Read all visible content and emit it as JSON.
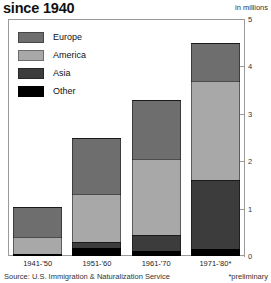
{
  "header": {
    "title": "since 1940",
    "units": "in millions"
  },
  "footer": {
    "source": "Source: U.S. Immigration & Naturalization Service",
    "footnote": "*preliminary"
  },
  "colors": {
    "europe": "#6e6e6e",
    "america": "#a8a8a8",
    "asia": "#3c3c3c",
    "other": "#000000",
    "axis": "#9a9a9a",
    "text": "#222222",
    "background": "#ffffff"
  },
  "legend": {
    "position": "top-left",
    "items": [
      {
        "label": "Europe",
        "color_key": "europe"
      },
      {
        "label": "America",
        "color_key": "america"
      },
      {
        "label": "Asia",
        "color_key": "asia"
      },
      {
        "label": "Other",
        "color_key": "other"
      }
    ]
  },
  "chart_data": {
    "type": "bar",
    "subtype": "stacked",
    "title": "since 1940",
    "xlabel": "",
    "ylabel": "in millions",
    "ylim": [
      0,
      5
    ],
    "yticks": [
      0,
      1,
      2,
      3,
      4,
      5
    ],
    "ytick_labels": [
      "0",
      "1",
      "2",
      "3",
      "4",
      "5"
    ],
    "grid": false,
    "categories": [
      "1941-'50",
      "1951-'60",
      "1961-'70",
      "1971-'80*"
    ],
    "series": [
      {
        "name": "Other",
        "values": [
          0.05,
          0.16,
          0.1,
          0.15
        ]
      },
      {
        "name": "Asia",
        "values": [
          0.0,
          0.14,
          0.35,
          1.45
        ]
      },
      {
        "name": "America",
        "values": [
          0.35,
          1.0,
          1.6,
          2.1
        ]
      },
      {
        "name": "Europe",
        "values": [
          0.64,
          1.2,
          1.25,
          0.8
        ]
      }
    ],
    "totals": [
      1.04,
      2.5,
      3.3,
      4.5
    ],
    "stack_order_bottom_to_top": [
      "Other",
      "Asia",
      "America",
      "Europe"
    ],
    "annotations": [
      "*preliminary"
    ]
  }
}
